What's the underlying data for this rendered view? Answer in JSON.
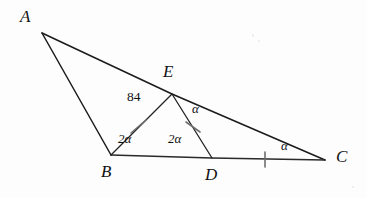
{
  "figure": {
    "type": "euclidean-geometry-diagram",
    "background_color": "#fdfdfd",
    "ink_color": "#1b1b1b",
    "tick_color": "#6f6f6f"
  },
  "points": {
    "A": {
      "label": "A",
      "x": 42,
      "y": 33,
      "label_x": 20,
      "label_y": 8
    },
    "B": {
      "label": "B",
      "x": 111,
      "y": 155,
      "label_x": 101,
      "label_y": 163
    },
    "C": {
      "label": "C",
      "x": 325,
      "y": 160,
      "label_x": 336,
      "label_y": 148
    },
    "D": {
      "label": "D",
      "x": 212,
      "y": 158,
      "label_x": 205,
      "label_y": 166
    },
    "E": {
      "label": "E",
      "x": 172,
      "y": 94,
      "label_x": 163,
      "label_y": 63
    }
  },
  "segments": [
    {
      "name": "AB",
      "from": "A",
      "to": "B",
      "style": "solid"
    },
    {
      "name": "AC",
      "from": "A",
      "to": "C",
      "style": "solid"
    },
    {
      "name": "BC",
      "from": "B",
      "to": "C",
      "style": "baseline"
    },
    {
      "name": "BE",
      "from": "B",
      "to": "E",
      "style": "solid",
      "ticks": 1
    },
    {
      "name": "ED",
      "from": "E",
      "to": "D",
      "style": "solid",
      "ticks": 1
    },
    {
      "name": "DC",
      "from": "D",
      "to": "C",
      "style": "baseline",
      "ticks": 1
    }
  ],
  "equal_length_marks": [
    {
      "segment": "BE",
      "x": 138,
      "y": 127,
      "count": 1
    },
    {
      "segment": "ED",
      "x": 193,
      "y": 127,
      "count": 1
    },
    {
      "segment": "DC",
      "x": 265,
      "y": 159,
      "count": 1
    }
  ],
  "angle_labels": [
    {
      "name": "angle-at-E-upper",
      "text": "84",
      "vertex": "E",
      "x": 127,
      "y": 90,
      "kind": "numeric"
    },
    {
      "name": "angle-AEB-alpha",
      "text": "α",
      "vertex": "E",
      "x": 192,
      "y": 102,
      "kind": "alpha"
    },
    {
      "name": "angle-EBD-2alpha",
      "text": "2α",
      "vertex": "B",
      "x": 118,
      "y": 132,
      "kind": "alpha"
    },
    {
      "name": "angle-EDB-2alpha",
      "text": "2α",
      "vertex": "D",
      "x": 168,
      "y": 132,
      "kind": "alpha"
    },
    {
      "name": "angle-ECD-alpha",
      "text": "α",
      "vertex": "C",
      "x": 281,
      "y": 139,
      "kind": "alpha"
    }
  ]
}
